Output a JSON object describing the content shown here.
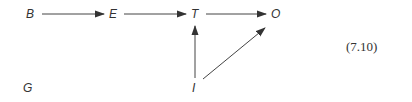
{
  "diagram": {
    "nodes": [
      {
        "id": "B",
        "label": "B",
        "x": 30,
        "y": 18
      },
      {
        "id": "E",
        "label": "E",
        "x": 113,
        "y": 18
      },
      {
        "id": "T",
        "label": "T",
        "x": 195,
        "y": 18
      },
      {
        "id": "O",
        "label": "O",
        "x": 276,
        "y": 18
      },
      {
        "id": "G",
        "label": "G",
        "x": 28,
        "y": 92
      },
      {
        "id": "I",
        "label": "I",
        "x": 194,
        "y": 92
      }
    ],
    "edges": [
      {
        "from": "B",
        "to": "E"
      },
      {
        "from": "E",
        "to": "T"
      },
      {
        "from": "T",
        "to": "O"
      },
      {
        "from": "I",
        "to": "T"
      },
      {
        "from": "I",
        "to": "O"
      }
    ],
    "equation_number": "(7.10)",
    "colors": {
      "ink": "#333333",
      "background": "#ffffff"
    }
  }
}
